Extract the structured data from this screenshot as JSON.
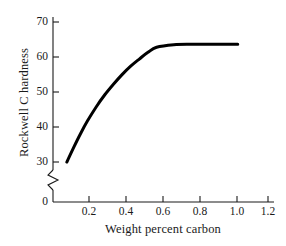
{
  "chart_data": {
    "type": "line",
    "title": "",
    "xlabel": "Weight percent carbon",
    "ylabel": "Rockwell C hardness",
    "xlim": [
      0,
      1.28
    ],
    "ylim": [
      28,
      72
    ],
    "grid": false,
    "legend": null,
    "axis_break": {
      "axis": "y",
      "between": [
        0,
        28
      ],
      "symbol": "zigzag"
    },
    "xticks": [
      0.2,
      0.4,
      0.6,
      0.8,
      1.0,
      1.2
    ],
    "xtick_labels": [
      "0.2",
      "0.4",
      "0.6",
      "0.8",
      "1.0",
      "1.2"
    ],
    "yticks": [
      30,
      40,
      50,
      60,
      70
    ],
    "ytick_labels": [
      "30",
      "40",
      "50",
      "60",
      "70"
    ],
    "origin_label": "0",
    "series": [
      {
        "name": "Rockwell C hardness vs weight percent carbon",
        "color": "#000000",
        "linewidth": 3,
        "x": [
          0.08,
          0.12,
          0.16,
          0.2,
          0.25,
          0.3,
          0.35,
          0.4,
          0.45,
          0.5,
          0.55,
          0.6,
          0.7,
          0.8,
          0.9,
          1.0,
          1.07
        ],
        "y": [
          37.5,
          41.0,
          44.3,
          47.3,
          50.6,
          53.5,
          56.0,
          58.3,
          60.3,
          62.0,
          63.6,
          64.8,
          65.4,
          65.5,
          65.5,
          65.5,
          65.5
        ]
      }
    ]
  },
  "axis": {
    "line_color": "#1a1a1a"
  }
}
